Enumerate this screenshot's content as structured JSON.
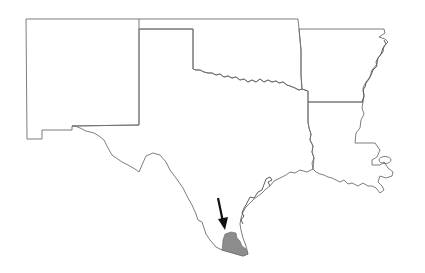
{
  "map": {
    "type": "state outline map",
    "states": [
      {
        "name": "New Mexico"
      },
      {
        "name": "Texas"
      },
      {
        "name": "Oklahoma"
      },
      {
        "name": "Arkansas"
      },
      {
        "name": "Louisiana"
      }
    ],
    "highlight": {
      "description": "shaded region in southern Texas near the Gulf coast",
      "color": "#8c8c8c"
    },
    "arrow": {
      "description": "black arrow pointing down to shaded region",
      "color": "#111111"
    },
    "colors": {
      "background": "#ffffff",
      "border": "#6e6e6e",
      "highlight": "#8c8c8c",
      "arrow": "#111111"
    }
  }
}
